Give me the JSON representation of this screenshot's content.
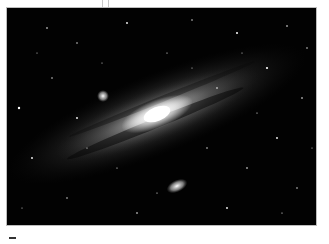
{
  "image": {
    "subject": "Andromeda Galaxy (M31) with satellite galaxies",
    "alt": "Andromeda galaxy spiral seen at an angle with bright core, dust lanes and two small companion galaxies against a star-filled black sky",
    "colors": {
      "background": "#020202",
      "core": "#ffffff",
      "disk": "#8a8a8a",
      "page": "#ffffff"
    },
    "features": {
      "main_galaxy": {
        "cx": 150,
        "cy": 110,
        "rx": 150,
        "ry": 32,
        "rotation": -22
      },
      "companion_upper": {
        "cx": 103,
        "cy": 96,
        "r": 5
      },
      "companion_lower": {
        "cx": 177,
        "cy": 186,
        "rx": 9,
        "ry": 5,
        "rotation": -25
      }
    }
  }
}
